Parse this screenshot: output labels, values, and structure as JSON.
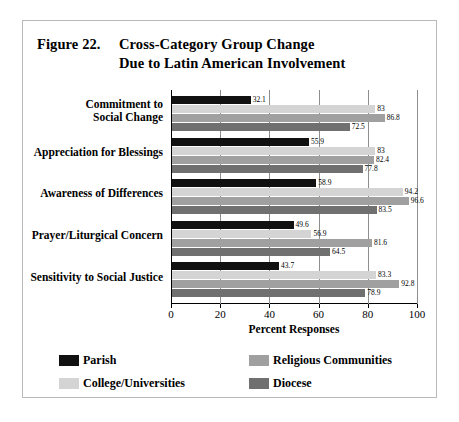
{
  "figure": {
    "number_label": "Figure 22.",
    "title_line1": "Cross-Category Group Change",
    "title_line2": "Due to Latin American Involvement"
  },
  "legend": {
    "position": "bottom",
    "items": [
      {
        "label": "Parish",
        "color": "#111111"
      },
      {
        "label": "Religious Communities",
        "color": "#a0a0a0"
      },
      {
        "label": "College/Universities",
        "color": "#d4d4d4"
      },
      {
        "label": "Diocese",
        "color": "#707070"
      }
    ]
  },
  "axis": {
    "x_title": "Percent Responses",
    "x_ticks": [
      "0",
      "20",
      "40",
      "60",
      "80",
      "100"
    ]
  },
  "chart_data": {
    "type": "bar",
    "orientation": "horizontal",
    "title": "Figure 22. Cross-Category Group Change Due to Latin American Involvement",
    "xlabel": "Percent Responses",
    "ylabel": "",
    "xlim": [
      0,
      100
    ],
    "grid": true,
    "legend_position": "bottom",
    "categories": [
      "Commitment to\nSocial Change",
      "Appreciation for Blessings",
      "Awareness of Differences",
      "Prayer/Liturgical Concern",
      "Sensitivity to Social Justice"
    ],
    "category_labels": [
      [
        "Commitment to",
        "Social Change"
      ],
      [
        "Appreciation for Blessings"
      ],
      [
        "Awareness of Differences"
      ],
      [
        "Prayer/Liturgical Concern"
      ],
      [
        "Sensitivity to Social Justice"
      ]
    ],
    "series": [
      {
        "name": "Parish",
        "color": "#111111",
        "values": [
          32.1,
          55.9,
          58.9,
          49.6,
          43.7
        ],
        "labels": [
          "32.1",
          "55.9",
          "58.9",
          "49.6",
          "43.7"
        ]
      },
      {
        "name": "College/Universities",
        "color": "#d4d4d4",
        "values": [
          83,
          83,
          94.2,
          56.9,
          83.3
        ],
        "labels": [
          "83",
          "83",
          "94.2",
          "56.9",
          "83.3"
        ]
      },
      {
        "name": "Religious Communities",
        "color": "#a0a0a0",
        "values": [
          86.8,
          82.4,
          96.6,
          81.6,
          92.8
        ],
        "labels": [
          "86.8",
          "82.4",
          "96.6",
          "81.6",
          "92.8"
        ]
      },
      {
        "name": "Diocese",
        "color": "#707070",
        "values": [
          72.5,
          77.8,
          83.5,
          64.5,
          78.9
        ],
        "labels": [
          "72.5",
          "77.8",
          "83.5",
          "64.5",
          "78.9"
        ]
      }
    ]
  }
}
